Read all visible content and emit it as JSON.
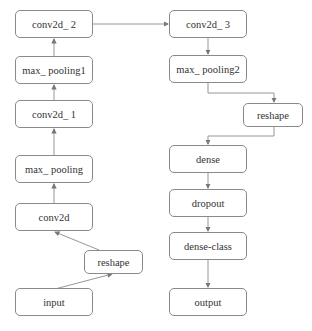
{
  "diagram": {
    "type": "neural-network-architecture",
    "nodes": [
      {
        "id": "conv2d_2",
        "label": "conv2d_ 2",
        "x": 15,
        "y": 10,
        "w": 78,
        "h": 28
      },
      {
        "id": "max_pooling1",
        "label": "max_ pooling1",
        "x": 15,
        "y": 56,
        "w": 78,
        "h": 28
      },
      {
        "id": "conv2d_1",
        "label": "conv2d_ 1",
        "x": 15,
        "y": 100,
        "w": 78,
        "h": 28
      },
      {
        "id": "max_pooling",
        "label": "max_ pooling",
        "x": 15,
        "y": 155,
        "w": 78,
        "h": 28
      },
      {
        "id": "conv2d",
        "label": "conv2d",
        "x": 15,
        "y": 203,
        "w": 78,
        "h": 28
      },
      {
        "id": "reshape_left",
        "label": "reshape",
        "x": 84,
        "y": 250,
        "w": 59,
        "h": 24
      },
      {
        "id": "input",
        "label": "input",
        "x": 15,
        "y": 288,
        "w": 78,
        "h": 28
      },
      {
        "id": "conv2d_3",
        "label": "conv2d_ 3",
        "x": 169,
        "y": 10,
        "w": 78,
        "h": 28
      },
      {
        "id": "max_pooling2",
        "label": "max_ pooling2",
        "x": 169,
        "y": 55,
        "w": 78,
        "h": 28
      },
      {
        "id": "reshape_right",
        "label": "reshape",
        "x": 243,
        "y": 103,
        "w": 60,
        "h": 24
      },
      {
        "id": "dense",
        "label": "dense",
        "x": 169,
        "y": 145,
        "w": 78,
        "h": 28
      },
      {
        "id": "dropout",
        "label": "dropout",
        "x": 169,
        "y": 189,
        "w": 78,
        "h": 28
      },
      {
        "id": "dense_class",
        "label": "dense-class",
        "x": 169,
        "y": 232,
        "w": 78,
        "h": 28
      },
      {
        "id": "output",
        "label": "output",
        "x": 169,
        "y": 288,
        "w": 78,
        "h": 28
      }
    ],
    "edges": [
      {
        "from": "input",
        "to": "reshape_left"
      },
      {
        "from": "reshape_left",
        "to": "conv2d"
      },
      {
        "from": "conv2d",
        "to": "max_pooling"
      },
      {
        "from": "max_pooling",
        "to": "conv2d_1"
      },
      {
        "from": "conv2d_1",
        "to": "max_pooling1"
      },
      {
        "from": "max_pooling1",
        "to": "conv2d_2"
      },
      {
        "from": "conv2d_2",
        "to": "conv2d_3"
      },
      {
        "from": "conv2d_3",
        "to": "max_pooling2"
      },
      {
        "from": "max_pooling2",
        "to": "reshape_right"
      },
      {
        "from": "reshape_right",
        "to": "dense"
      },
      {
        "from": "dense",
        "to": "dropout"
      },
      {
        "from": "dropout",
        "to": "dense_class"
      },
      {
        "from": "dense_class",
        "to": "output"
      }
    ],
    "colors": {
      "stroke": "#8a8a8a",
      "arrow": "#777777",
      "text": "#333333"
    }
  }
}
